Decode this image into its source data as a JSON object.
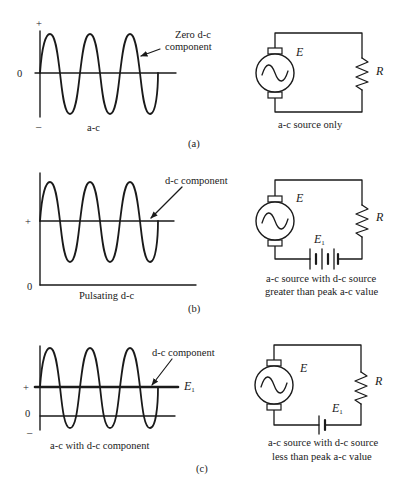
{
  "figure": {
    "panels": [
      {
        "id": "a",
        "label": "(a)",
        "waveform": {
          "plus_sign": "+",
          "zero_label": "0",
          "minus_sign": "–",
          "caption": "a-c",
          "annotation_line1": "Zero d-c",
          "annotation_line2": "component"
        },
        "circuit": {
          "source_label": "E",
          "resistor_label": "R",
          "caption_line1": "a-c source only",
          "caption_line2": ""
        }
      },
      {
        "id": "b",
        "label": "(b)",
        "waveform": {
          "plus_sign": "+",
          "zero_label": "0",
          "caption": "Pulsating d-c",
          "annotation_line1": "d-c component"
        },
        "circuit": {
          "source_label": "E",
          "resistor_label": "R",
          "battery_label": "E",
          "battery_subscript": "1",
          "caption_line1": "a-c source with d-c source",
          "caption_line2": "greater than peak a-c value"
        }
      },
      {
        "id": "c",
        "label": "(c)",
        "waveform": {
          "plus_sign": "+",
          "zero_label": "0",
          "minus_sign": "–",
          "caption": "a-c with d-c component",
          "annotation_line1": "d-c component",
          "dc_level_label": "E",
          "dc_level_subscript": "1"
        },
        "circuit": {
          "source_label": "E",
          "resistor_label": "R",
          "battery_label": "E",
          "battery_subscript": "1",
          "caption_line1": "a-c source with d-c source",
          "caption_line2": "less than peak a-c value"
        }
      }
    ]
  },
  "colors": {
    "ink": "#1a1a1a",
    "background": "#ffffff"
  }
}
